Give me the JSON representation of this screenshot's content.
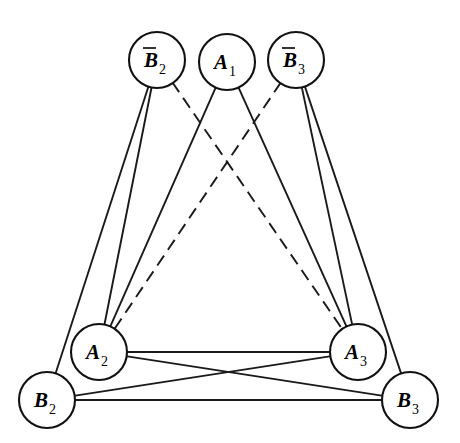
{
  "figure": {
    "kind": "graph-diagram",
    "background_color": "#ffffff",
    "line_color": "#1a1a1a",
    "node_fill_color": "#ffffff",
    "node_stroke_color": "#111111",
    "width": 460,
    "height": 443
  },
  "nodes": [
    {
      "id": "Bbar2",
      "base": "B",
      "subscript": "2",
      "overbar": true,
      "label": "B̅2",
      "cx": 157,
      "cy": 60,
      "r": 28
    },
    {
      "id": "A1",
      "base": "A",
      "subscript": "1",
      "overbar": false,
      "label": "A1",
      "cx": 227,
      "cy": 62,
      "r": 28
    },
    {
      "id": "Bbar3",
      "base": "B",
      "subscript": "3",
      "overbar": true,
      "label": "B̅3",
      "cx": 296,
      "cy": 60,
      "r": 28
    },
    {
      "id": "A2",
      "base": "A",
      "subscript": "2",
      "overbar": false,
      "label": "A2",
      "cx": 99,
      "cy": 352,
      "r": 28
    },
    {
      "id": "A3",
      "base": "A",
      "subscript": "3",
      "overbar": false,
      "label": "A3",
      "cx": 358,
      "cy": 352,
      "r": 28
    },
    {
      "id": "B2",
      "base": "B",
      "subscript": "2",
      "overbar": false,
      "label": "B2",
      "cx": 47,
      "cy": 400,
      "r": 28
    },
    {
      "id": "B3",
      "base": "B",
      "subscript": "3",
      "overbar": false,
      "label": "B3",
      "cx": 410,
      "cy": 400,
      "r": 28
    }
  ],
  "edges": [
    {
      "id": "e1",
      "from": "Bbar2",
      "to": "B2",
      "style": "solid"
    },
    {
      "id": "e2",
      "from": "Bbar2",
      "to": "A2",
      "style": "solid"
    },
    {
      "id": "e3",
      "from": "Bbar2",
      "to": "A3",
      "style": "dashed"
    },
    {
      "id": "e4",
      "from": "A1",
      "to": "A2",
      "style": "solid"
    },
    {
      "id": "e5",
      "from": "A1",
      "to": "A3",
      "style": "solid"
    },
    {
      "id": "e6",
      "from": "Bbar3",
      "to": "A2",
      "style": "dashed"
    },
    {
      "id": "e7",
      "from": "Bbar3",
      "to": "A3",
      "style": "solid"
    },
    {
      "id": "e8",
      "from": "Bbar3",
      "to": "B3",
      "style": "solid"
    },
    {
      "id": "e9",
      "from": "A2",
      "to": "A3",
      "style": "solid"
    },
    {
      "id": "e10",
      "from": "B2",
      "to": "A3",
      "style": "solid"
    },
    {
      "id": "e11",
      "from": "A2",
      "to": "B3",
      "style": "solid"
    },
    {
      "id": "e12",
      "from": "B2",
      "to": "B3",
      "style": "solid"
    }
  ]
}
